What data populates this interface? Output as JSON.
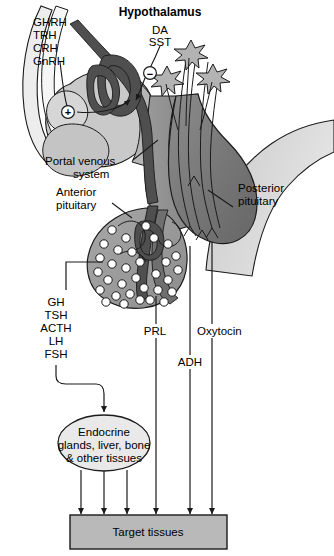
{
  "figure": {
    "title": "Hypothalamus"
  },
  "labels": {
    "hypothalamus": "Hypothalamus",
    "releasing_hormones": [
      "GHRH",
      "TRH",
      "CRH",
      "GnRH"
    ],
    "inhibiting_hormones": [
      "DA",
      "SST"
    ],
    "portal_venous_system": [
      "Portal venous",
      "system"
    ],
    "anterior_pituitary": [
      "Anterior",
      "pituitary"
    ],
    "posterior_pituitary": [
      "Posterior",
      "pituitary"
    ],
    "anterior_hormones": [
      "GH",
      "TSH",
      "ACTH",
      "LH",
      "FSH"
    ],
    "prolactin": "PRL",
    "adh": "ADH",
    "oxytocin": "Oxytocin",
    "endocrine_target": [
      "Endocrine",
      "glands, liver, bone",
      "& other tissues"
    ],
    "target_tissues": "Target tissues",
    "stimulatory_sign": "+",
    "inhibitory_sign": "−"
  },
  "colors": {
    "background": "#ffffff",
    "stroke": "#1a1a1a",
    "brain_light": "#d2d2d2",
    "brain_mid": "#bdbdbd",
    "anterior_pituitary": "#9b9b9b",
    "posterior_pituitary": "#767676",
    "stalk": "#8c8c8c",
    "portal_vessel": "#4f4f4f",
    "cell_fill": "#ffffff",
    "box_fill": "#b9b9b9",
    "ellipse_fill": "#e8e8e8",
    "neuron_fill": "#b0b0b0"
  }
}
